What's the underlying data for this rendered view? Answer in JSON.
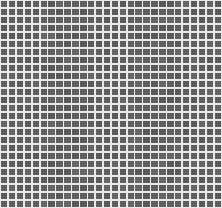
{
  "image": {
    "description": "Mosaic of small dark gray square tiles separated by light grout lines",
    "grid": {
      "columns": 28,
      "rows": 26
    },
    "colors": {
      "tile": "#5c5c5c",
      "grout": "#e9e9e9"
    }
  }
}
